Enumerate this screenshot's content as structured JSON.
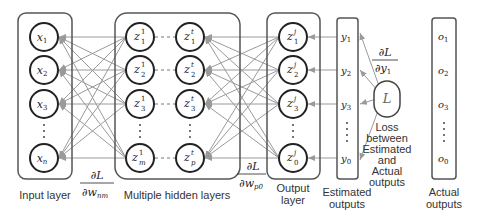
{
  "diagram": {
    "type": "neural-network-backpropagation",
    "layers": {
      "input": {
        "label": "Input layer",
        "nodes": [
          "x1",
          "x2",
          "x3",
          "xn"
        ],
        "node_display": [
          {
            "base": "x",
            "sub": "1"
          },
          {
            "base": "x",
            "sub": "2"
          },
          {
            "base": "x",
            "sub": "3"
          },
          {
            "base": "x",
            "sub": "n"
          }
        ]
      },
      "hidden": {
        "label": "Multiple hidden layers",
        "first_column": [
          {
            "base": "z",
            "sub": "1",
            "sup": "1"
          },
          {
            "base": "z",
            "sub": "2",
            "sup": "1"
          },
          {
            "base": "z",
            "sub": "3",
            "sup": "1"
          },
          {
            "base": "z",
            "sub": "m",
            "sup": "1"
          }
        ],
        "last_column": [
          {
            "base": "z",
            "sub": "1",
            "sup": "t"
          },
          {
            "base": "z",
            "sub": "2",
            "sup": "t"
          },
          {
            "base": "z",
            "sub": "3",
            "sup": "t"
          },
          {
            "base": "z",
            "sub": "p",
            "sup": "t"
          }
        ]
      },
      "output": {
        "label_line1": "Output",
        "label_line2": "layer",
        "nodes": [
          {
            "base": "z",
            "sub": "1",
            "sup": "j"
          },
          {
            "base": "z",
            "sub": "2",
            "sup": "j"
          },
          {
            "base": "z",
            "sub": "3",
            "sup": "j"
          },
          {
            "base": "z",
            "sub": "0",
            "sup": "j"
          }
        ]
      },
      "estimated": {
        "label_line1": "Estimated",
        "label_line2": "outputs",
        "values": [
          {
            "base": "y",
            "sub": "1"
          },
          {
            "base": "y",
            "sub": "2"
          },
          {
            "base": "y",
            "sub": "3"
          },
          {
            "base": "y",
            "sub": "0"
          }
        ]
      },
      "actual": {
        "label_line1": "Actual",
        "label_line2": "outputs",
        "values": [
          {
            "base": "o",
            "sub": "1"
          },
          {
            "base": "o",
            "sub": "2"
          },
          {
            "base": "o",
            "sub": "3"
          },
          {
            "base": "o",
            "sub": "0"
          }
        ]
      }
    },
    "loss": {
      "symbol": "L",
      "caption_lines": [
        "Loss",
        "between",
        "Estimated",
        "and",
        "Actual",
        "outputs"
      ]
    },
    "gradients": {
      "input_weights": {
        "num": "∂L",
        "den_base": "∂w",
        "den_sub": "nm"
      },
      "output_weights": {
        "num": "∂L",
        "den_base": "∂w",
        "den_sub": "p0"
      },
      "estimated": {
        "num": "∂L",
        "den_base": "∂y",
        "den_sub": "1"
      }
    },
    "colors": {
      "node_stroke": "#222222",
      "box_stroke": "#555555",
      "edge": "#9a9a9a",
      "text": "#333333"
    }
  }
}
